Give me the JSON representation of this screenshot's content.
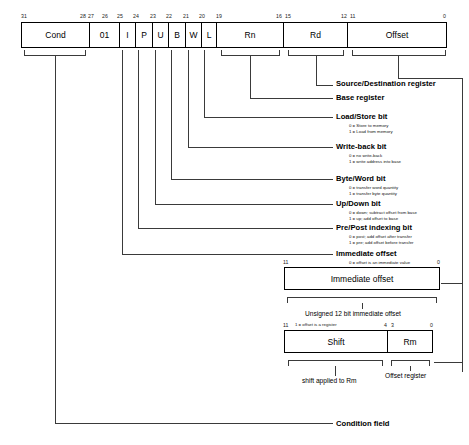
{
  "diagram": {
    "instruction_bar": {
      "fields": [
        {
          "name": "cond",
          "label": "Cond",
          "hi": 31,
          "lo": 28
        },
        {
          "name": "opcode",
          "label": "01",
          "hi": 27,
          "lo": 26
        },
        {
          "name": "i",
          "label": "I",
          "hi": 25,
          "lo": 25
        },
        {
          "name": "p",
          "label": "P",
          "hi": 24,
          "lo": 24
        },
        {
          "name": "u",
          "label": "U",
          "hi": 23,
          "lo": 23
        },
        {
          "name": "b",
          "label": "B",
          "hi": 22,
          "lo": 22
        },
        {
          "name": "w",
          "label": "W",
          "hi": 21,
          "lo": 21
        },
        {
          "name": "l",
          "label": "L",
          "hi": 20,
          "lo": 20
        },
        {
          "name": "rn",
          "label": "Rn",
          "hi": 19,
          "lo": 16
        },
        {
          "name": "rd",
          "label": "Rd",
          "hi": 15,
          "lo": 12
        },
        {
          "name": "offset",
          "label": "Offset",
          "hi": 11,
          "lo": 0
        }
      ],
      "bit_labels": [
        {
          "text": "31",
          "x": 22,
          "align": "left"
        },
        {
          "text": "28",
          "x": 84,
          "align": "right"
        },
        {
          "text": "27",
          "x": 89,
          "align": "left"
        },
        {
          "text": "26",
          "x": 112,
          "align": "right"
        },
        {
          "text": "25",
          "x": 118,
          "align": "left"
        },
        {
          "text": "24",
          "x": 135,
          "align": "left"
        },
        {
          "text": "23",
          "x": 152,
          "align": "left"
        },
        {
          "text": "22",
          "x": 169,
          "align": "left"
        },
        {
          "text": "21",
          "x": 186,
          "align": "left"
        },
        {
          "text": "20",
          "x": 202,
          "align": "left"
        },
        {
          "text": "19",
          "x": 220,
          "align": "left"
        },
        {
          "text": "16",
          "x": 282,
          "align": "right"
        },
        {
          "text": "15",
          "x": 288,
          "align": "left"
        },
        {
          "text": "12",
          "x": 347,
          "align": "right"
        },
        {
          "text": "11",
          "x": 353,
          "align": "left"
        },
        {
          "text": "0",
          "x": 447,
          "align": "right"
        }
      ]
    },
    "annotations": [
      {
        "id": "source-destination-register",
        "title": "Source/Destination register",
        "sublines": []
      },
      {
        "id": "base-register",
        "title": "Base register",
        "sublines": []
      },
      {
        "id": "load-store-bit",
        "title": "Load/Store bit",
        "sublines": [
          "0 = Store to memory",
          "1 = Load from memory"
        ]
      },
      {
        "id": "write-back-bit",
        "title": "Write-back bit",
        "sublines": [
          "0 = no write-back",
          "1 = write address into base"
        ]
      },
      {
        "id": "byte-word-bit",
        "title": "Byte/Word bit",
        "sublines": [
          "0 = transfer word quantity",
          "1 = transfer byte quantity"
        ]
      },
      {
        "id": "up-down-bit",
        "title": "Up/Down bit",
        "sublines": [
          "0 = down; subtract offset from base",
          "1 = up; add offset to base"
        ]
      },
      {
        "id": "pre-post-indexing-bit",
        "title": "Pre/Post indexing bit",
        "sublines": [
          "0 = post; add offset after transfer",
          "1 = pre; add offset before transfer"
        ]
      },
      {
        "id": "immediate-offset",
        "title": "Immediate offset",
        "sublines": [
          "0 = offset is an immediate value"
        ]
      },
      {
        "id": "condition-field",
        "title": "Condition field",
        "sublines": []
      }
    ],
    "immediate_box": {
      "label": "Immediate offset",
      "bit_hi": "11",
      "bit_lo": "0",
      "caption": "Unsigned 12 bit immediate offset"
    },
    "register_box": {
      "note": "1 = offset is a register",
      "bit_hi": "11",
      "bit_mid_hi": "4",
      "bit_mid_lo": "3",
      "bit_lo": "0",
      "fields": [
        {
          "name": "shift",
          "label": "Shift",
          "caption": "shift applied to Rm"
        },
        {
          "name": "rm",
          "label": "Rm",
          "caption": "Offset register"
        }
      ]
    }
  }
}
